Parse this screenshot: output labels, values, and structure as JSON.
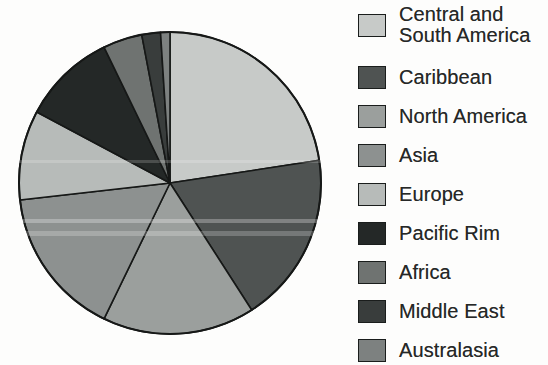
{
  "figure": {
    "background_color": "#fdfdfc",
    "outline_color": "#161817",
    "text_color": "#262827"
  },
  "chart_data": {
    "type": "pie",
    "title": "",
    "legend_position": "right",
    "start_angle_deg": 0,
    "direction": "clockwise",
    "center_px": {
      "x": 170,
      "y": 183,
      "radius": 151
    },
    "slices": [
      {
        "label": "Central and South America",
        "label_lines": [
          "Central and",
          "South America"
        ],
        "value_pct": 22.6,
        "color": "#c7cac8"
      },
      {
        "label": "Caribbean",
        "label_lines": [
          "Caribbean"
        ],
        "value_pct": 18.3,
        "color": "#4f5352"
      },
      {
        "label": "North America",
        "label_lines": [
          "North America"
        ],
        "value_pct": 16.3,
        "color": "#9b9f9d"
      },
      {
        "label": "Asia",
        "label_lines": [
          "Asia"
        ],
        "value_pct": 16.0,
        "color": "#8d9190"
      },
      {
        "label": "Europe",
        "label_lines": [
          "Europe"
        ],
        "value_pct": 9.6,
        "color": "#b7bbb9"
      },
      {
        "label": "Pacific Rim",
        "label_lines": [
          "Pacific Rim"
        ],
        "value_pct": 10.0,
        "color": "#242827"
      },
      {
        "label": "Africa",
        "label_lines": [
          "Africa"
        ],
        "value_pct": 4.2,
        "color": "#6f7371"
      },
      {
        "label": "Middle East",
        "label_lines": [
          "Middle East"
        ],
        "value_pct": 2.0,
        "color": "#393d3c"
      },
      {
        "label": "Australasia",
        "label_lines": [
          "Australasia"
        ],
        "value_pct": 1.0,
        "color": "#7d8180"
      }
    ]
  }
}
